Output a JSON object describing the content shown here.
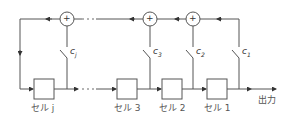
{
  "diagram": {
    "type": "linear feedback shift register",
    "cells": [
      {
        "id": "cell-j",
        "label": "セル j",
        "x": 34
      },
      {
        "id": "cell-3",
        "label": "セル 3",
        "x": 117
      },
      {
        "id": "cell-2",
        "label": "セル 2",
        "x": 162
      },
      {
        "id": "cell-1",
        "label": "セル 1",
        "x": 207
      }
    ],
    "coefficients": [
      {
        "id": "cj",
        "label": "c",
        "sub": "j"
      },
      {
        "id": "c3",
        "label": "c",
        "sub": "3"
      },
      {
        "id": "c2",
        "label": "c",
        "sub": "2"
      },
      {
        "id": "c1",
        "label": "c",
        "sub": "1"
      }
    ],
    "adder_symbol": "+",
    "ellipsis": "···",
    "output_label": "出力"
  }
}
